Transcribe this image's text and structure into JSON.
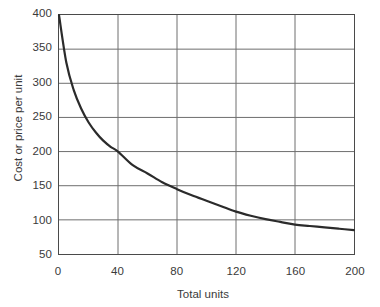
{
  "chart_data": {
    "type": "line",
    "title": "",
    "subtitle": "",
    "xlabel": "Total units",
    "ylabel": "Cost or price per unit",
    "xlim": [
      0,
      200
    ],
    "ylim": [
      50,
      400
    ],
    "grid": true,
    "legend": null,
    "legend_position": "none",
    "x_ticks": [
      0,
      40,
      80,
      120,
      160,
      200
    ],
    "x_tick_labels": [
      "0",
      "40",
      "80",
      "120",
      "160",
      "200"
    ],
    "y_ticks": [
      50,
      100,
      150,
      200,
      250,
      300,
      350,
      400
    ],
    "y_tick_labels": [
      "50",
      "100",
      "150",
      "200",
      "250",
      "300",
      "350",
      "400"
    ],
    "series": [
      {
        "name": "Experience curve",
        "color": "#2b2b2b",
        "x": [
          0,
          5,
          10,
          15,
          20,
          25,
          30,
          35,
          40,
          50,
          60,
          70,
          80,
          90,
          100,
          110,
          120,
          130,
          140,
          150,
          160,
          170,
          180,
          190,
          200
        ],
        "values": [
          400,
          330,
          290,
          263,
          243,
          228,
          216,
          207,
          200,
          180,
          168,
          155,
          145,
          136,
          128,
          120,
          112,
          106,
          101,
          97,
          93,
          91,
          89,
          87,
          85
        ]
      }
    ],
    "annotations": []
  },
  "axes": {
    "y_title": "Cost or price per unit",
    "x_title": "Total units"
  },
  "colors": {
    "curve": "#2b2b2b",
    "gridline": "#6e6e6e",
    "axis_border": "#4a4a4a",
    "text": "#3a3a3a",
    "background": "#ffffff"
  }
}
